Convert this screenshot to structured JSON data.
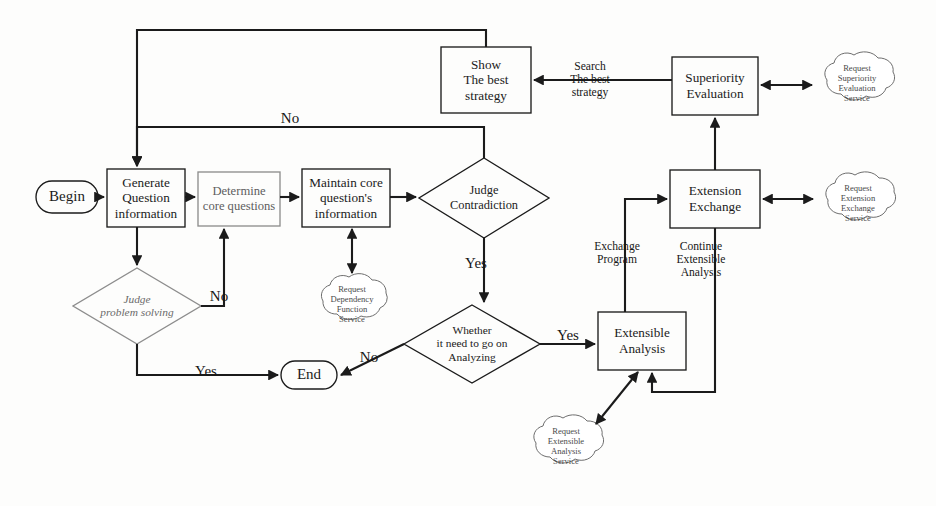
{
  "diagram": {
    "background_color": "#fdfdfc",
    "stroke_color": "#1b1b1b",
    "faint_stroke_color": "#8a8a8a"
  },
  "nodes": {
    "begin": {
      "label": "Begin",
      "shape": "terminator",
      "x": 36,
      "y": 181,
      "w": 62,
      "h": 32
    },
    "generate_question": {
      "label": "Generate\nQuestion\ninformation",
      "shape": "process",
      "x": 107,
      "y": 169,
      "w": 78,
      "h": 58
    },
    "determine_core": {
      "label": "Determine\ncore questions",
      "shape": "process",
      "x": 198,
      "y": 172,
      "w": 82,
      "h": 54,
      "faint": true
    },
    "maintain_core": {
      "label": "Maintain core\nquestion's\ninformation",
      "shape": "process",
      "x": 302,
      "y": 169,
      "w": 88,
      "h": 58
    },
    "judge_contradiction": {
      "label": "Judge\nContradiction",
      "shape": "decision",
      "x": 419,
      "y": 158,
      "w": 130,
      "h": 80
    },
    "show_best_strategy": {
      "label": "Show\nThe best\nstrategy",
      "shape": "process",
      "x": 441,
      "y": 47,
      "w": 90,
      "h": 66
    },
    "superiority_evaluation": {
      "label": "Superiority\nEvaluation",
      "shape": "process",
      "x": 672,
      "y": 57,
      "w": 86,
      "h": 58
    },
    "extension_exchange": {
      "label": "Extension\nExchange",
      "shape": "process",
      "x": 670,
      "y": 170,
      "w": 90,
      "h": 58
    },
    "judge_problem_solving": {
      "label": "Judge\nproblem  solving",
      "shape": "decision",
      "x": 73,
      "y": 268,
      "w": 128,
      "h": 76,
      "faint": true
    },
    "whether_go_on": {
      "label": "Whether\nit need to go on\nAnalyzing",
      "shape": "decision",
      "x": 404,
      "y": 305,
      "w": 136,
      "h": 78
    },
    "extensible_analysis": {
      "label": "Extensible\nAnalysis",
      "shape": "process",
      "x": 598,
      "y": 312,
      "w": 88,
      "h": 58
    },
    "end": {
      "label": "End",
      "shape": "terminator",
      "x": 281,
      "y": 361,
      "w": 56,
      "h": 28
    }
  },
  "clouds": {
    "dependency_function": {
      "label": "Request\nDependency\nFunction\nService",
      "cx": 352,
      "cy": 303,
      "rw": 46,
      "rh": 35
    },
    "superiority_service": {
      "label": "Request\nSuperiority\nEvaluation\nService",
      "cx": 857,
      "cy": 82,
      "rw": 48,
      "rh": 38
    },
    "extension_service": {
      "label": "Request\nExtension\nExchange\nService",
      "cx": 858,
      "cy": 202,
      "rw": 48,
      "rh": 38
    },
    "extensible_service": {
      "label": "Request\nExtensible\nAnalysis\nService",
      "cx": 566,
      "cy": 445,
      "rw": 48,
      "rh": 38
    }
  },
  "edge_labels": {
    "no_contradiction": {
      "text": "No",
      "x": 273,
      "y": 110
    },
    "search_best_strategy": {
      "text": "Search\nThe best\nstrategy",
      "x": 583,
      "y": 60
    },
    "yes_contradiction": {
      "text": "Yes",
      "x": 456,
      "y": 262
    },
    "no_problem_solving": {
      "text": "No",
      "x": 207,
      "y": 288
    },
    "yes_problem_solving": {
      "text": "Yes",
      "x": 190,
      "y": 363
    },
    "no_go_on": {
      "text": "No",
      "x": 355,
      "y": 351
    },
    "yes_go_on": {
      "text": "Yes",
      "x": 554,
      "y": 330
    },
    "exchange_program": {
      "text": "Exchange\nProgram",
      "x": 610,
      "y": 245
    },
    "continue_extensible": {
      "text": "Continue\nExtensible\nAnalysis",
      "x": 690,
      "y": 245
    }
  }
}
